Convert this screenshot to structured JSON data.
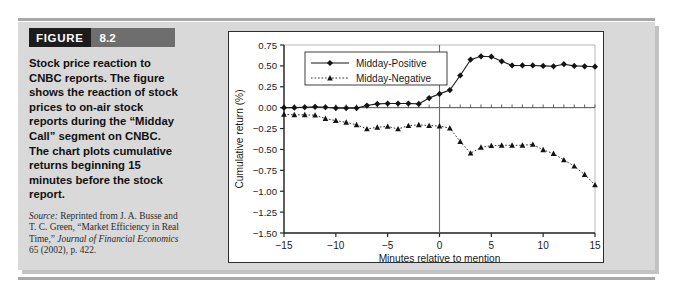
{
  "figure": {
    "tag_word": "FIGURE",
    "tag_number": "8.2",
    "caption": "Stock price reaction to CNBC reports. The figure shows the reaction of stock prices to on-air stock reports during the “Midday Call” segment on CNBC. The chart plots cumulative returns beginning 15 minutes before the stock report.",
    "source_label": "Source:",
    "source_text_1": " Reprinted from J. A. Busse and T. C. Green, “Market Efficiency in Real Time,” ",
    "source_italic_1": "Journal of Financial Economics",
    "source_text_2": " 65 (2002), p. 422."
  },
  "chart_data": {
    "type": "line",
    "title": "",
    "xlabel": "Minutes relative to mention",
    "ylabel": "Cumulative return (%)",
    "xlim": [
      -15,
      15
    ],
    "ylim": [
      -1.5,
      0.75
    ],
    "xticks": [
      -15,
      -10,
      -5,
      0,
      5,
      10,
      15
    ],
    "xtick_labels": [
      "−15",
      "−10",
      "−5",
      "0",
      "5",
      "10",
      "15"
    ],
    "yticks": [
      0.75,
      0.5,
      0.25,
      0.0,
      -0.25,
      -0.5,
      -0.75,
      -1.0,
      -1.25,
      -1.5
    ],
    "ytick_labels": [
      "0.75",
      "0.50",
      "0.25",
      "0.00",
      "−0.25",
      "−0.50",
      "−0.75",
      "−1.00",
      "−1.25",
      "−1.50"
    ],
    "minor_xtick_step": 1,
    "grid": false,
    "legend_position": "upper-left-inside",
    "zero_line": true,
    "event_line_x": 0,
    "x": [
      -15,
      -14,
      -13,
      -12,
      -11,
      -10,
      -9,
      -8,
      -7,
      -6,
      -5,
      -4,
      -3,
      -2,
      -1,
      0,
      1,
      2,
      3,
      4,
      5,
      6,
      7,
      8,
      9,
      10,
      11,
      12,
      13,
      14,
      15
    ],
    "series": [
      {
        "name": "Midday-Positive",
        "marker": "diamond",
        "linestyle": "solid",
        "color": "#1a1a1a",
        "values": [
          0.0,
          0.0,
          0.005,
          0.01,
          0.005,
          -0.005,
          -0.005,
          -0.005,
          0.025,
          0.045,
          0.05,
          0.05,
          0.05,
          0.045,
          0.115,
          0.165,
          0.21,
          0.385,
          0.575,
          0.615,
          0.61,
          0.555,
          0.505,
          0.505,
          0.505,
          0.5,
          0.495,
          0.52,
          0.5,
          0.495,
          0.49
        ]
      },
      {
        "name": "Midday-Negative",
        "marker": "triangle",
        "linestyle": "dotted",
        "color": "#1a1a1a",
        "values": [
          -0.08,
          -0.085,
          -0.085,
          -0.09,
          -0.13,
          -0.155,
          -0.175,
          -0.205,
          -0.255,
          -0.235,
          -0.225,
          -0.255,
          -0.215,
          -0.205,
          -0.215,
          -0.22,
          -0.245,
          -0.405,
          -0.545,
          -0.475,
          -0.455,
          -0.45,
          -0.45,
          -0.45,
          -0.44,
          -0.505,
          -0.55,
          -0.625,
          -0.7,
          -0.8,
          -0.925
        ]
      }
    ],
    "legend": [
      {
        "label": "Midday-Positive",
        "marker": "diamond",
        "linestyle": "solid"
      },
      {
        "label": "Midday-Negative",
        "marker": "triangle",
        "linestyle": "dotted"
      }
    ]
  }
}
